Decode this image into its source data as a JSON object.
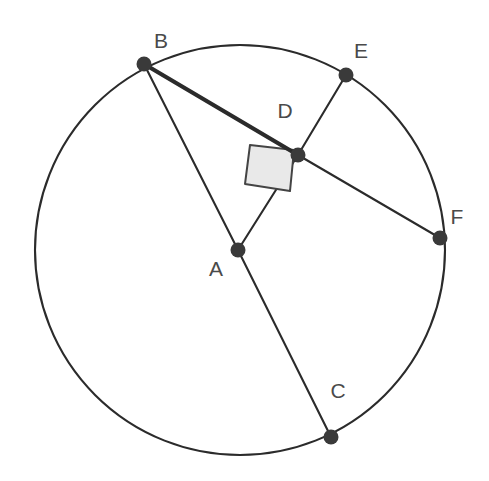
{
  "figure": {
    "background_color": "#ffffff",
    "stroke_color": "#2b2b2b",
    "label_color": "#4a4a4a",
    "point_fill_color": "#3a3a3a",
    "right_angle_fill": "#e9e9e9",
    "width": 489,
    "height": 481
  },
  "circle": {
    "name": "main-circle",
    "center_x": 240,
    "center_y": 250,
    "radius": 205,
    "stroke_width": 2.1
  },
  "points": [
    {
      "id": "A",
      "label": "A",
      "x": 238,
      "y": 250,
      "radius": 7.5,
      "label_x": 216,
      "label_y": 270,
      "role": "center"
    },
    {
      "id": "B",
      "label": "B",
      "x": 144,
      "y": 64,
      "radius": 7.5,
      "label_x": 161,
      "label_y": 42,
      "role": "on-circle"
    },
    {
      "id": "C",
      "label": "C",
      "x": 331,
      "y": 437,
      "radius": 7.5,
      "label_x": 338,
      "label_y": 392,
      "role": "on-circle"
    },
    {
      "id": "D",
      "label": "D",
      "x": 298,
      "y": 155,
      "radius": 7.5,
      "label_x": 285,
      "label_y": 112,
      "role": "intersection"
    },
    {
      "id": "E",
      "label": "E",
      "x": 346,
      "y": 75,
      "radius": 7.5,
      "label_x": 361,
      "label_y": 52,
      "role": "on-circle"
    },
    {
      "id": "F",
      "label": "F",
      "x": 440,
      "y": 238,
      "radius": 7.5,
      "label_x": 457,
      "label_y": 218,
      "role": "on-circle"
    }
  ],
  "segments": [
    {
      "name": "segment-BD",
      "from": "B",
      "to": "D",
      "x1": 144,
      "y1": 64,
      "x2": 298,
      "y2": 155,
      "stroke_width": 4.2,
      "emphasis": "bold"
    },
    {
      "name": "segment-DF",
      "from": "D",
      "to": "F",
      "x1": 298,
      "y1": 155,
      "x2": 440,
      "y2": 238,
      "stroke_width": 2.1,
      "emphasis": "normal"
    },
    {
      "name": "segment-BA",
      "from": "B",
      "to": "A",
      "x1": 144,
      "y1": 64,
      "x2": 238,
      "y2": 250,
      "stroke_width": 2.1,
      "emphasis": "normal"
    },
    {
      "name": "segment-AC",
      "from": "A",
      "to": "C",
      "x1": 238,
      "y1": 250,
      "x2": 331,
      "y2": 437,
      "stroke_width": 2.1,
      "emphasis": "normal"
    },
    {
      "name": "segment-AD",
      "from": "A",
      "to": "D",
      "x1": 238,
      "y1": 250,
      "x2": 298,
      "y2": 155,
      "stroke_width": 2.1,
      "emphasis": "normal"
    },
    {
      "name": "segment-DE",
      "from": "D",
      "to": "E",
      "x1": 298,
      "y1": 155,
      "x2": 346,
      "y2": 75,
      "stroke_width": 2.1,
      "emphasis": "normal"
    }
  ],
  "right_angle_marker": {
    "name": "right-angle-at-D",
    "at_point": "D",
    "between": "BD and AD",
    "points": "294,150 250,145 245,184 290,191",
    "fill": "#e9e9e9",
    "stroke": "#444444",
    "stroke_width": 2
  }
}
